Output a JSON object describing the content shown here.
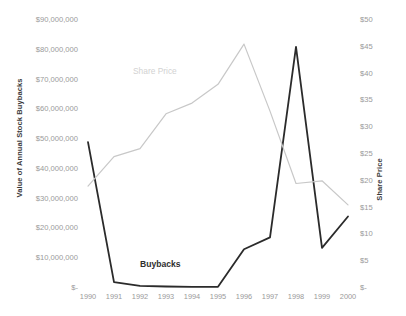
{
  "chart_data": {
    "type": "line",
    "title": "",
    "subtitle": "",
    "xlabel": "",
    "ylabel": "Value of Annual Stock Buybacks",
    "y2label": "Share Price",
    "grid": false,
    "legend_position": "inline-annotation",
    "x": [
      "1990",
      "1991",
      "1992",
      "1993",
      "1994",
      "1995",
      "1996",
      "1997",
      "1998",
      "1999",
      "2000"
    ],
    "categories": [
      "1990",
      "1991",
      "1992",
      "1993",
      "1994",
      "1995",
      "1996",
      "1997",
      "1998",
      "1999",
      "2000"
    ],
    "ylim": [
      0,
      90000000
    ],
    "y2lim": [
      0,
      50
    ],
    "yticks": [
      "$-",
      "$10,000,000",
      "$20,000,000",
      "$30,000,000",
      "$40,000,000",
      "$50,000,000",
      "$60,000,000",
      "$70,000,000",
      "$80,000,000",
      "$90,000,000"
    ],
    "ytick_values": [
      0,
      10000000,
      20000000,
      30000000,
      40000000,
      50000000,
      60000000,
      70000000,
      80000000,
      90000000
    ],
    "y2ticks": [
      "$-",
      "$5",
      "$10",
      "$15",
      "$20",
      "$25",
      "$30",
      "$35",
      "$40",
      "$45",
      "$50"
    ],
    "y2tick_values": [
      0,
      5,
      10,
      15,
      20,
      25,
      30,
      35,
      40,
      45,
      50
    ],
    "series": [
      {
        "name": "Buybacks",
        "axis": "left",
        "color": "#2b2b2b",
        "values": [
          49000000,
          2000000,
          700000,
          500000,
          400000,
          400000,
          13000000,
          17000000,
          81000000,
          13500000,
          24000000
        ]
      },
      {
        "name": "Share Price",
        "axis": "right",
        "color": "#c8c8c8",
        "values": [
          19.0,
          24.5,
          26.0,
          32.5,
          34.5,
          38.0,
          45.5,
          33.0,
          19.5,
          20.0,
          15.5
        ]
      }
    ],
    "annotations": [
      {
        "text": "Share Price",
        "x": "1993",
        "color": "#d2d2d2"
      },
      {
        "text": "Buybacks",
        "x": "1994",
        "color": "#2f2f2f"
      }
    ]
  },
  "axes": {
    "left_title": "Value of Annual Stock Buybacks",
    "right_title": "Share Price"
  },
  "caption": ""
}
